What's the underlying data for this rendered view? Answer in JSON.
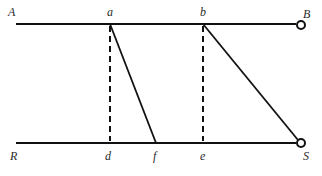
{
  "diagram": {
    "labels": {
      "A": "A",
      "a": "a",
      "b": "b",
      "B": "B",
      "R": "R",
      "d": "d",
      "f": "f",
      "e": "e",
      "S": "S"
    },
    "points": {
      "A": [
        16,
        24
      ],
      "a": [
        110,
        24
      ],
      "b": [
        203,
        24
      ],
      "B": [
        301,
        24
      ],
      "R": [
        16,
        143
      ],
      "d": [
        110,
        143
      ],
      "f": [
        156,
        143
      ],
      "e": [
        203,
        143
      ],
      "S": [
        301,
        143
      ]
    },
    "lines": [
      {
        "from": "A",
        "to": "B",
        "style": "solid"
      },
      {
        "from": "R",
        "to": "S",
        "style": "solid"
      },
      {
        "from": "a",
        "to": "d",
        "style": "dashed"
      },
      {
        "from": "b",
        "to": "e",
        "style": "dashed"
      },
      {
        "from": "a",
        "to": "f",
        "style": "solid"
      },
      {
        "from": "b",
        "to": "S",
        "style": "solid"
      }
    ],
    "endpoints": [
      {
        "at": "B",
        "marker": "open-circle"
      },
      {
        "at": "S",
        "marker": "open-circle"
      }
    ],
    "colors": {
      "stroke": "#111111",
      "text": "#2a2a2a",
      "background": "#ffffff"
    }
  }
}
